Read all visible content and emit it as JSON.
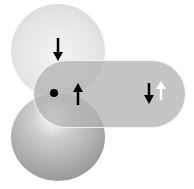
{
  "diagram": {
    "type": "orbital-overlap",
    "elements": [
      {
        "id": "top-sphere",
        "shape": "sphere",
        "color": "#e8e8e8",
        "spin": "down"
      },
      {
        "id": "bottom-sphere",
        "shape": "sphere",
        "color": "#a0a0a0"
      },
      {
        "id": "bond-pill",
        "shape": "rounded-rectangle",
        "color": "#afafaf"
      },
      {
        "id": "nucleus-dot",
        "shape": "dot",
        "color": "#000000"
      },
      {
        "id": "center-arrow",
        "direction": "up",
        "color": "#000000"
      },
      {
        "id": "right-arrow-pair",
        "arrows": [
          {
            "direction": "down",
            "color": "#000000"
          },
          {
            "direction": "up",
            "color": "#ffffff"
          }
        ]
      }
    ]
  }
}
